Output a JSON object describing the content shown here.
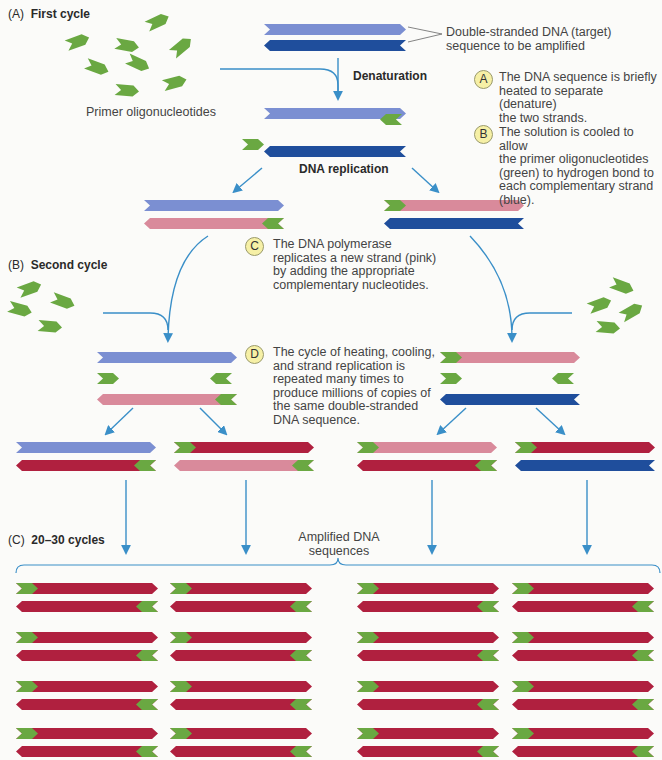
{
  "colors": {
    "light_blue": "#7b8fd2",
    "dark_blue": "#1f4e9c",
    "pink": "#d98a9b",
    "crimson": "#b0203f",
    "green": "#6aa842",
    "arrow": "#3a8fc8",
    "text": "#3a3a3a"
  },
  "sections": {
    "a": {
      "prefix": "(A)",
      "title": "First cycle"
    },
    "b": {
      "prefix": "(B)",
      "title": "Second cycle"
    },
    "c": {
      "prefix": "(C)",
      "title": "20–30 cycles"
    }
  },
  "labels": {
    "primers": "Primer oligonucleotides",
    "target": "Double-stranded DNA (target)\nsequence to be amplified",
    "denaturation": "Denaturation",
    "dna_replication": "DNA replication",
    "amplified": "Amplified DNA\nsequences"
  },
  "steps": [
    {
      "id": "A",
      "text": "The DNA sequence is briefly\nheated to separate (denature)\nthe two strands."
    },
    {
      "id": "B",
      "text": "The solution is cooled to allow\nthe primer oligonucleotides\n(green) to hydrogen bond to\neach complementary strand\n(blue)."
    },
    {
      "id": "C",
      "text": "The DNA polymerase\nreplicates a new strand (pink)\nby adding the appropriate\ncomplementary nucleotides."
    },
    {
      "id": "D",
      "text": "The cycle of heating, cooling,\nand strand replication is\nrepeated many times to\nproduce millions of copies of\nthe same double-stranded\nDNA sequence."
    }
  ],
  "strands": [
    {
      "x": 264,
      "y": 24,
      "w": 142,
      "dir": "r",
      "color": "light_blue"
    },
    {
      "x": 264,
      "y": 40,
      "w": 142,
      "dir": "l",
      "color": "dark_blue"
    },
    {
      "x": 264,
      "y": 108,
      "w": 142,
      "dir": "r",
      "color": "light_blue"
    },
    {
      "x": 264,
      "y": 146,
      "w": 142,
      "dir": "l",
      "color": "dark_blue"
    },
    {
      "x": 144,
      "y": 200,
      "w": 140,
      "dir": "r",
      "color": "light_blue"
    },
    {
      "x": 144,
      "y": 218,
      "w": 140,
      "dir": "l",
      "color": "pink",
      "primer": "right"
    },
    {
      "x": 384,
      "y": 200,
      "w": 140,
      "dir": "r",
      "color": "pink",
      "primer": "left"
    },
    {
      "x": 384,
      "y": 218,
      "w": 140,
      "dir": "l",
      "color": "dark_blue"
    },
    {
      "x": 97,
      "y": 352,
      "w": 140,
      "dir": "r",
      "color": "light_blue"
    },
    {
      "x": 97,
      "y": 394,
      "w": 140,
      "dir": "l",
      "color": "pink",
      "primer": "right"
    },
    {
      "x": 440,
      "y": 352,
      "w": 140,
      "dir": "r",
      "color": "pink",
      "primer": "left"
    },
    {
      "x": 440,
      "y": 394,
      "w": 140,
      "dir": "l",
      "color": "dark_blue"
    },
    {
      "x": 16,
      "y": 442,
      "w": 140,
      "dir": "r",
      "color": "light_blue"
    },
    {
      "x": 16,
      "y": 460,
      "w": 140,
      "dir": "l",
      "color": "crimson",
      "primer": "right"
    },
    {
      "x": 174,
      "y": 442,
      "w": 140,
      "dir": "r",
      "color": "crimson",
      "primer": "left"
    },
    {
      "x": 174,
      "y": 460,
      "w": 140,
      "dir": "l",
      "color": "pink",
      "primer": "right"
    },
    {
      "x": 357,
      "y": 442,
      "w": 140,
      "dir": "r",
      "color": "pink",
      "primer": "left"
    },
    {
      "x": 357,
      "y": 460,
      "w": 140,
      "dir": "l",
      "color": "crimson",
      "primer": "right"
    },
    {
      "x": 515,
      "y": 442,
      "w": 140,
      "dir": "r",
      "color": "crimson",
      "primer": "left"
    },
    {
      "x": 515,
      "y": 460,
      "w": 140,
      "dir": "l",
      "color": "dark_blue"
    }
  ],
  "loose_primers": [
    {
      "x": 242,
      "y": 139,
      "dir": "r"
    },
    {
      "x": 380,
      "y": 114,
      "dir": "l"
    },
    {
      "x": 97,
      "y": 373,
      "dir": "r"
    },
    {
      "x": 210,
      "y": 373,
      "dir": "l"
    },
    {
      "x": 440,
      "y": 373,
      "dir": "r"
    },
    {
      "x": 552,
      "y": 373,
      "dir": "l"
    }
  ],
  "free_primers": [
    {
      "x": 78,
      "y": 42,
      "r": -20
    },
    {
      "x": 158,
      "y": 22,
      "r": -25
    },
    {
      "x": 127,
      "y": 46,
      "r": 10
    },
    {
      "x": 182,
      "y": 47,
      "r": -40
    },
    {
      "x": 97,
      "y": 68,
      "r": 20
    },
    {
      "x": 138,
      "y": 64,
      "r": 25
    },
    {
      "x": 127,
      "y": 91,
      "r": 5
    },
    {
      "x": 175,
      "y": 83,
      "r": -15
    },
    {
      "x": 30,
      "y": 289,
      "r": -20
    },
    {
      "x": 20,
      "y": 310,
      "r": 15
    },
    {
      "x": 63,
      "y": 302,
      "r": 20
    },
    {
      "x": 50,
      "y": 327,
      "r": 5
    },
    {
      "x": 622,
      "y": 287,
      "r": 20
    },
    {
      "x": 600,
      "y": 305,
      "r": -20
    },
    {
      "x": 632,
      "y": 312,
      "r": -30
    },
    {
      "x": 608,
      "y": 328,
      "r": 5
    }
  ],
  "amplified_grid": {
    "columns_x": [
      16,
      170,
      357,
      512
    ],
    "rows_y": [
      583,
      632,
      681,
      728
    ],
    "strand_width": 142,
    "gap": 18
  }
}
